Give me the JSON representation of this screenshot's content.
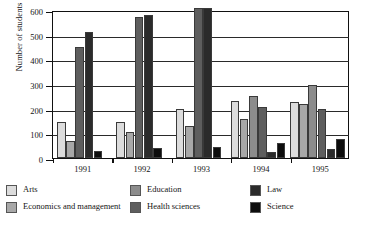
{
  "chart_data": {
    "type": "bar",
    "title": "",
    "subtitle": "",
    "xlabel": "",
    "ylabel": "Number of students",
    "categories": [
      "1991",
      "1992",
      "1993",
      "1994",
      "1995"
    ],
    "ylim": [
      0,
      600
    ],
    "yticks": [
      0,
      100,
      200,
      300,
      400,
      500,
      600
    ],
    "ytick_labels": [
      "0",
      "100",
      "200",
      "300",
      "400",
      "500",
      "600"
    ],
    "grid": true,
    "grid_axis": "y",
    "legend_position": "bottom",
    "clipped_note": "In 1993 the Health sciences and Law bars extend beyond the top of the 600 axis.",
    "series": [
      {
        "name": "Arts",
        "color": "#dcdcdc",
        "values": [
          145,
          145,
          197,
          230,
          226
        ]
      },
      {
        "name": "Economics and management",
        "color": "#a8a8a8",
        "values": [
          70,
          104,
          128,
          160,
          221
        ]
      },
      {
        "name": "Education",
        "color": "#8c8c8c",
        "values": [
          0,
          0,
          0,
          250,
          298
        ]
      },
      {
        "name": "Health sciences",
        "color": "#5e5e5e",
        "values": [
          450,
          572,
          610,
          205,
          197
        ]
      },
      {
        "name": "Law",
        "color": "#2b2b2b",
        "values": [
          511,
          581,
          612,
          26,
          35
        ]
      },
      {
        "name": "Science",
        "color": "#0d0d0d",
        "values": [
          30,
          39,
          45,
          59,
          78
        ]
      }
    ]
  },
  "legend": {
    "columns": [
      [
        "Arts",
        "Economics and management"
      ],
      [
        "Education",
        "Health sciences"
      ],
      [
        "Law",
        "Science"
      ]
    ]
  }
}
